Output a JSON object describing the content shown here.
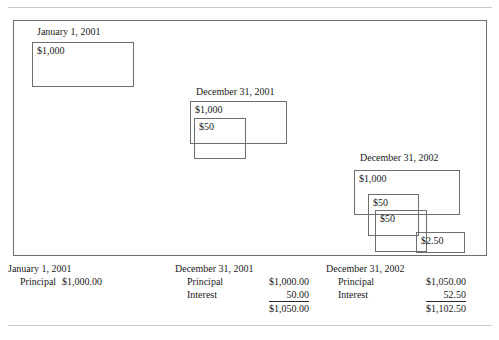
{
  "diagram": {
    "groups": [
      {
        "id": "jan-1-2001",
        "caption": "January 1, 2001",
        "boxes": [
          {
            "id": "principal",
            "label": "$1,000"
          }
        ]
      },
      {
        "id": "dec-31-2001",
        "caption": "December 31, 2001",
        "boxes": [
          {
            "id": "principal",
            "label": "$1,000"
          },
          {
            "id": "interest-1",
            "label": "$50"
          }
        ]
      },
      {
        "id": "dec-31-2002",
        "caption": "December 31, 2002",
        "boxes": [
          {
            "id": "principal",
            "label": "$1,000"
          },
          {
            "id": "interest-1",
            "label": "$50"
          },
          {
            "id": "interest-2",
            "label": "$50"
          },
          {
            "id": "interest-compound",
            "label": "$2.50"
          }
        ]
      }
    ]
  },
  "summary": {
    "columns": [
      {
        "id": "january-1-2001",
        "title": "January 1, 2001",
        "rows": [
          {
            "label": "Principal",
            "value": "$1,000.00"
          }
        ],
        "total": null
      },
      {
        "id": "december-31-2001",
        "title": "December 31, 2001",
        "rows": [
          {
            "label": "Principal",
            "value": "$1,000.00"
          },
          {
            "label": "Interest",
            "value": "50.00"
          }
        ],
        "total": "$1,050.00"
      },
      {
        "id": "december-31-2002",
        "title": "December 31, 2002",
        "rows": [
          {
            "label": "Principal",
            "value": "$1,050.00"
          },
          {
            "label": "Interest",
            "value": "52.50"
          }
        ],
        "total": "$1,102.50"
      }
    ]
  }
}
